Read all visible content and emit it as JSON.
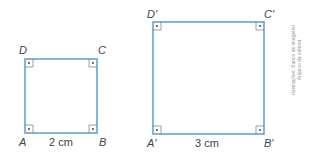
{
  "figure": {
    "colors": {
      "square_stroke": "#5b9bd5",
      "marker_stroke": "#777777",
      "text": "#444444"
    },
    "squares": [
      {
        "name": "ABCD",
        "side_label": "2 cm",
        "vertices": {
          "D": "D",
          "C": "C",
          "A": "A",
          "B": "B"
        },
        "right_angle_markers": 4
      },
      {
        "name": "A'B'C'D'",
        "side_label": "3 cm",
        "vertices": {
          "D": "D'",
          "C": "C'",
          "A": "A'",
          "B": "B'"
        },
        "right_angle_markers": 4
      }
    ],
    "credit": [
      "Ilustrações: Banco de imagens/",
      "Arquivo da editora"
    ]
  }
}
